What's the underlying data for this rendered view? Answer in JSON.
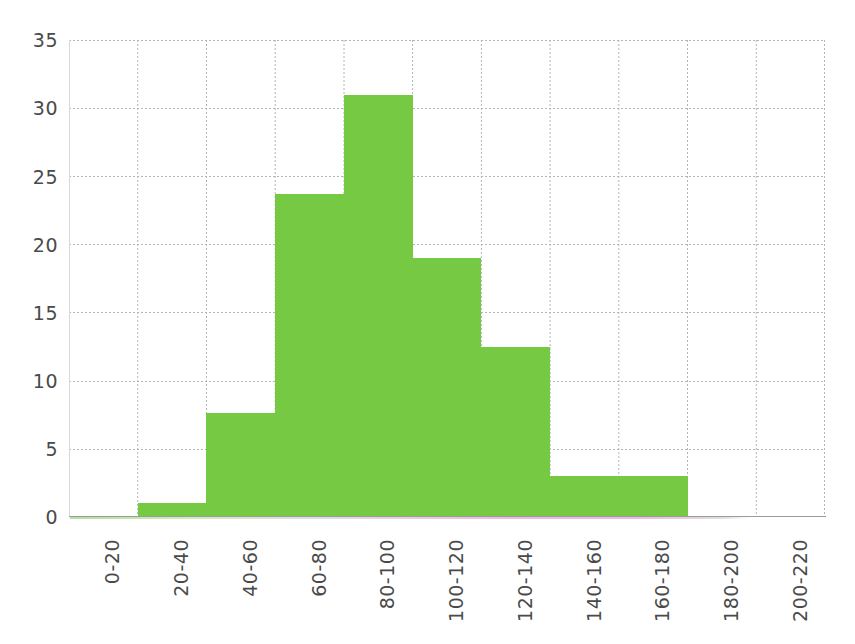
{
  "chart_data": {
    "type": "bar",
    "title": "",
    "subtitle": "",
    "xlabel": "",
    "ylabel": "",
    "categories": [
      "0-20",
      "20-40",
      "40-60",
      "60-80",
      "80-100",
      "100-120",
      "120-140",
      "140-160",
      "160-180",
      "180-200",
      "200-220"
    ],
    "values": [
      0,
      1,
      7.6,
      23.7,
      31,
      19,
      12.5,
      3,
      3,
      0,
      0
    ],
    "series": [
      {
        "name": "Frequency",
        "values": [
          0,
          1,
          7.6,
          23.7,
          31,
          19,
          12.5,
          3,
          3,
          0,
          0
        ],
        "color": "#76c943"
      }
    ],
    "ylim": [
      0,
      35
    ],
    "yticks": [
      0,
      5,
      10,
      15,
      20,
      25,
      30,
      35
    ],
    "ytick_labels": [
      "0",
      "5",
      "10",
      "15",
      "20",
      "25",
      "30",
      "35"
    ],
    "xtick_labels": [
      "0-20",
      "20-40",
      "40-60",
      "60-80",
      "80-100",
      "100-120",
      "120-140",
      "140-160",
      "160-180",
      "180-200",
      "200-220"
    ],
    "xtick_rotation": 90,
    "grid": true,
    "grid_style": "dotted",
    "grid_color": "#b4b4b4",
    "legend": false,
    "legend_position": "none",
    "bar_gap": 0,
    "annotations": []
  },
  "style": {
    "bar_color": "#76c943",
    "axis_color": "#9b9b9b",
    "tick_label_color": "#4a4a4a",
    "background": "#ffffff"
  }
}
